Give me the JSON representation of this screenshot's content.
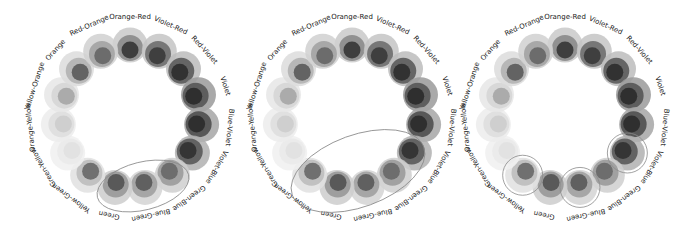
{
  "diagram": {
    "type": "color-wheel-harmony",
    "segment_angle_step_deg": 24,
    "start_angle_deg": -90,
    "ring_radius": 72,
    "label_radius": 100,
    "colors": [
      {
        "name": "Orange-Red",
        "outer": "#c9c9c9",
        "mid": "#8a8a8a",
        "inner": "#3a3a3a"
      },
      {
        "name": "Violet-Red",
        "outer": "#c4c4c4",
        "mid": "#6e6e6e",
        "inner": "#3c3c3c"
      },
      {
        "name": "Red-Violet",
        "outer": "#bcbcbc",
        "mid": "#5a5a5a",
        "inner": "#2f2f2f"
      },
      {
        "name": "Violet",
        "outer": "#9a9a9a",
        "mid": "#555555",
        "inner": "#2c2c2c"
      },
      {
        "name": "Blue-Violet",
        "outer": "#a6a6a6",
        "mid": "#4e4e4e",
        "inner": "#2d2d2d"
      },
      {
        "name": "Violet-Blue",
        "outer": "#b0b0b0",
        "mid": "#595959",
        "inner": "#333333"
      },
      {
        "name": "Green-Blue",
        "outer": "#cfcfcf",
        "mid": "#9b9b9b",
        "inner": "#6a6a6a"
      },
      {
        "name": "Blue-Green",
        "outer": "#d4d4d4",
        "mid": "#a0a0a0",
        "inner": "#5c5c5c"
      },
      {
        "name": "Green",
        "outer": "#cccccc",
        "mid": "#989898",
        "inner": "#555555"
      },
      {
        "name": "Yellow-Green",
        "outer": "#e0e0e0",
        "mid": "#bdbdbd",
        "inner": "#6b6b6b"
      },
      {
        "name": "Green-Yellow",
        "outer": "#f0f0f0",
        "mid": "#eaeaea",
        "inner": "#e2e2e2"
      },
      {
        "name": "Orange-Yellow",
        "outer": "#ececec",
        "mid": "#dedede",
        "inner": "#cdcdcd"
      },
      {
        "name": "Yellow-Orange",
        "outer": "#e6e6e6",
        "mid": "#d6d6d6",
        "inner": "#a9a9a9"
      },
      {
        "name": "Orange",
        "outer": "#dcdcdc",
        "mid": "#b2b2b2",
        "inner": "#5e5e5e"
      },
      {
        "name": "Red-Orange",
        "outer": "#d0d0d0",
        "mid": "#a3a3a3",
        "inner": "#686868"
      }
    ],
    "wheels": [
      {
        "id": "analogous-3",
        "center": [
          130,
          117
        ],
        "highlight": {
          "kind": "ellipse",
          "cx": 143,
          "cy": 186,
          "rx": 47,
          "ry": 24,
          "rotate": -14
        },
        "highlighted_colors": [
          "Green",
          "Blue-Green",
          "Green-Blue"
        ]
      },
      {
        "id": "analogous-5",
        "center": [
          352,
          117
        ],
        "highlight": {
          "kind": "ellipse",
          "cx": 358,
          "cy": 171,
          "rx": 70,
          "ry": 36,
          "rotate": -20
        },
        "highlighted_colors": [
          "Yellow-Green",
          "Green",
          "Blue-Green",
          "Green-Blue",
          "Violet-Blue"
        ]
      },
      {
        "id": "triad",
        "center": [
          565,
          117
        ],
        "highlight": {
          "kind": "circles",
          "r": 20
        },
        "highlighted_colors": [
          "Yellow-Green",
          "Blue-Green",
          "Violet-Blue"
        ]
      }
    ]
  }
}
